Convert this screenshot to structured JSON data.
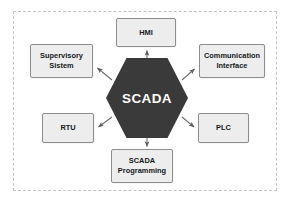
{
  "diagram": {
    "type": "hub-and-spoke",
    "hub": {
      "label": "SCADA",
      "shape": "hexagon",
      "fill_color": "#3a3a3a",
      "text_color": "#ffffff"
    },
    "frame": {
      "border_style": "dashed",
      "border_color": "#c2c2c2"
    },
    "node_style": {
      "fill_color": "#ededed",
      "border_color": "#8d8d8d",
      "text_color": "#15191c"
    },
    "connector_color": "#6e6e6e",
    "nodes": [
      {
        "id": "hmi",
        "label": "HMI",
        "position": "top"
      },
      {
        "id": "supervisory",
        "label": "Supervisory\nSistem",
        "position": "upper-left"
      },
      {
        "id": "communication",
        "label": "Communication\nInterface",
        "position": "upper-right"
      },
      {
        "id": "rtu",
        "label": "RTU",
        "position": "lower-left"
      },
      {
        "id": "plc",
        "label": "PLC",
        "position": "lower-right"
      },
      {
        "id": "programming",
        "label": "SCADA\nProgramming",
        "position": "bottom"
      }
    ],
    "edges": [
      {
        "from": "SCADA",
        "to": "HMI",
        "direction": "outward"
      },
      {
        "from": "SCADA",
        "to": "Supervisory Sistem",
        "direction": "outward"
      },
      {
        "from": "SCADA",
        "to": "Communication Interface",
        "direction": "outward"
      },
      {
        "from": "SCADA",
        "to": "RTU",
        "direction": "outward"
      },
      {
        "from": "SCADA",
        "to": "PLC",
        "direction": "outward"
      },
      {
        "from": "SCADA",
        "to": "SCADA Programming",
        "direction": "outward"
      }
    ]
  }
}
